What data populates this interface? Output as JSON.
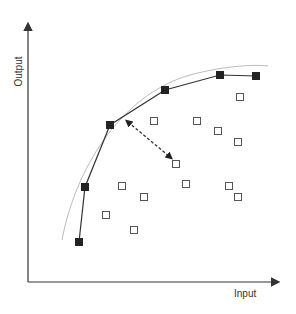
{
  "diagram": {
    "type": "production-frontier",
    "xlabel": "Input",
    "ylabel": "Output",
    "colors": {
      "axis": "#333333",
      "frontier": "#333333",
      "envelope": "#aaaaaa",
      "filled": "#222222",
      "open_stroke": "#555555"
    },
    "frontier_points": [
      [
        79,
        242
      ],
      [
        85,
        187
      ],
      [
        110,
        125
      ],
      [
        165,
        90
      ],
      [
        220,
        75
      ],
      [
        256,
        76
      ]
    ],
    "inefficient_points": [
      [
        240,
        97
      ],
      [
        154,
        121
      ],
      [
        197,
        121
      ],
      [
        218,
        131
      ],
      [
        238,
        142
      ],
      [
        176,
        164
      ],
      [
        122,
        186
      ],
      [
        144,
        197
      ],
      [
        186,
        184
      ],
      [
        229,
        186
      ],
      [
        238,
        197
      ],
      [
        106,
        215
      ],
      [
        134,
        230
      ]
    ],
    "distance_arrow": {
      "from": [
        128,
        122
      ],
      "to": [
        170,
        157
      ]
    }
  }
}
